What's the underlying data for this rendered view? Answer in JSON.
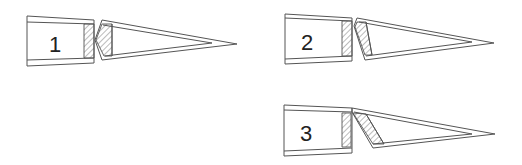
{
  "diagram": {
    "title": "",
    "stroke_color": "#555555",
    "panels": [
      {
        "id": "1",
        "label": "1",
        "label_pos": [
          49,
          52
        ],
        "left_outer": "M27,16 L94,20 L94,63 L27,66 Z",
        "left_inner_top": "M27,22 L94,24",
        "left_inner_bottom": "M27,60 L94,58",
        "left_hatch": "M84,24 L94,24 L94,58 L84,58 Z",
        "right_outer_top": "M102,20 L237,44",
        "right_outer_bottom": "M102,60 L237,44",
        "right_inner_top": "M103,25 L212,43",
        "right_inner_bottom": "M105,56 L212,43",
        "right_notch": "M102,20 L95,40 L102,60",
        "right_hatch": "M102,24 L112,24 L112,56 L104,56 L96,40 Z",
        "right_inner_left": "M112,24 L112,56"
      },
      {
        "id": "2",
        "label": "2",
        "label_pos": [
          301,
          50
        ],
        "left_outer": "M285,14 L352,18 L352,61 L285,64 Z",
        "left_inner_top": "M285,18 L352,21",
        "left_inner_bottom": "M285,59 L352,56",
        "left_hatch": "M342,21 L352,21 L352,56 L342,56 Z",
        "right_outer_top": "M357,18 L494,43",
        "right_outer_bottom": "M365,60 L494,43",
        "right_inner_top": "M359,22 L472,42",
        "right_inner_bottom": "M366,56 L472,42",
        "right_notch": "M357,18 L354,26 L365,60",
        "right_hatch": "M357,22 L366,22 L372,55 L365,55 L355,27 Z",
        "right_inner_left": "M366,22 L372,55"
      },
      {
        "id": "3",
        "label": "3",
        "label_pos": [
          300,
          141
        ],
        "left_outer": "M284,105 L352,108 L352,153 L284,156 Z",
        "left_inner_top": "M284,110 L352,112",
        "left_inner_bottom": "M284,151 L352,148",
        "left_hatch": "M342,113 L351,113 L351,147 L342,147 Z",
        "right_outer_top": "M352,108 L495,134",
        "right_outer_bottom": "M373,148 L495,134",
        "right_inner_top": "M354,112 L472,134",
        "right_inner_bottom": "M373,144 L472,134",
        "right_notch": "M352,108 L352,112 L373,148",
        "right_hatch": "M353,113 L366,114 L384,144 L373,144 Z",
        "right_inner_left": "M366,114 L384,144"
      }
    ]
  }
}
